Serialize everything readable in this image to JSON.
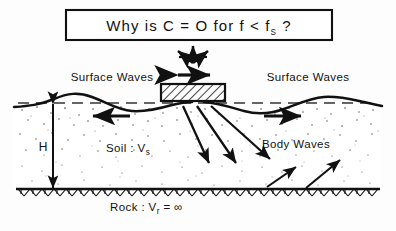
{
  "title_box": {
    "question": "Why is  C = O  for  f < f",
    "question_sub": "S",
    "question_tail": " ?",
    "full_text": "Why is C = O for f < fS ?"
  },
  "labels": {
    "surface_waves_left": "Surface Waves",
    "surface_waves_right": "Surface Waves",
    "body_waves": "Body Waves",
    "soil": "Soil :  V",
    "soil_sub": "s",
    "rock": "Rock :  V",
    "rock_sub": "r",
    "rock_tail": " = ∞",
    "depth": "H"
  },
  "colors": {
    "ink": "#111111",
    "background": "#fdfdfd",
    "soil_stipple": "#555555",
    "dashed_datum": "#333333"
  },
  "elements": {
    "foundation_block": "hatched rigid footing",
    "excitation_arrows": "trident rocking/vertical arrows",
    "sway_arrow": "horizontal double-headed arrow",
    "rock_interface": "chevron hatched rigid base"
  }
}
